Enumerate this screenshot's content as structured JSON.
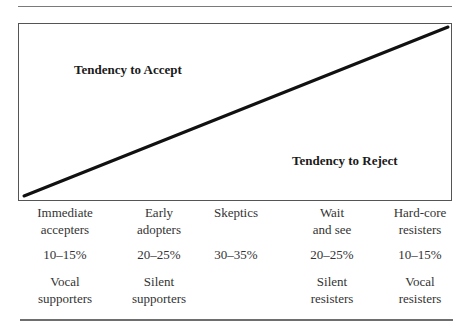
{
  "diagram": {
    "zones": {
      "accept_label": "Tendency to Accept",
      "reject_label": "Tendency to Reject"
    },
    "line": {
      "from": [
        23,
        196
      ],
      "to": [
        447,
        27
      ],
      "color": "#111111"
    }
  },
  "columns": [
    {
      "name_line1": "Immediate",
      "name_line2": "accepters",
      "percent": "10–15%",
      "role_line1": "Vocal",
      "role_line2": "supporters"
    },
    {
      "name_line1": "Early",
      "name_line2": "adopters",
      "percent": "20–25%",
      "role_line1": "Silent",
      "role_line2": "supporters"
    },
    {
      "name_line1": "Skeptics",
      "name_line2": "",
      "percent": "30–35%",
      "role_line1": "",
      "role_line2": ""
    },
    {
      "name_line1": "Wait",
      "name_line2": "and see",
      "percent": "20–25%",
      "role_line1": "Silent",
      "role_line2": "resisters"
    },
    {
      "name_line1": "Hard-core",
      "name_line2": "resisters",
      "percent": "10–15%",
      "role_line1": "Vocal",
      "role_line2": "resisters"
    }
  ]
}
